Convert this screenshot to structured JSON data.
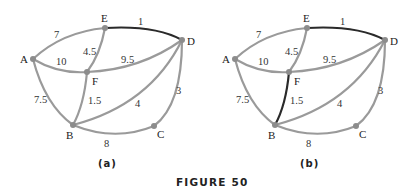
{
  "figure": {
    "caption": "FIGURE 50",
    "colors": {
      "edge": "#9a9a9a",
      "highlighted_edge": "#2a2a2a",
      "node": "#8c8c8c",
      "text": "#222222"
    }
  },
  "graphs": [
    {
      "sublabel": "(a)",
      "vertices": [
        "A",
        "B",
        "C",
        "D",
        "E",
        "F"
      ],
      "edges": [
        {
          "from": "A",
          "to": "E",
          "weight": "7",
          "highlighted": false
        },
        {
          "from": "E",
          "to": "D",
          "weight": "1",
          "highlighted": true
        },
        {
          "from": "E",
          "to": "F",
          "weight": "4.5",
          "highlighted": false
        },
        {
          "from": "A",
          "to": "F",
          "weight": "10",
          "highlighted": false
        },
        {
          "from": "F",
          "to": "D",
          "weight": "9.5",
          "highlighted": false
        },
        {
          "from": "A",
          "to": "B",
          "weight": "7.5",
          "highlighted": false
        },
        {
          "from": "F",
          "to": "B",
          "weight": "1.5",
          "highlighted": false
        },
        {
          "from": "B",
          "to": "D",
          "weight": "4",
          "highlighted": false
        },
        {
          "from": "D",
          "to": "C",
          "weight": "3",
          "highlighted": false
        },
        {
          "from": "B",
          "to": "C",
          "weight": "8",
          "highlighted": false
        }
      ]
    },
    {
      "sublabel": "(b)",
      "vertices": [
        "A",
        "B",
        "C",
        "D",
        "E",
        "F"
      ],
      "edges": [
        {
          "from": "A",
          "to": "E",
          "weight": "7",
          "highlighted": false
        },
        {
          "from": "E",
          "to": "D",
          "weight": "1",
          "highlighted": true
        },
        {
          "from": "E",
          "to": "F",
          "weight": "4.5",
          "highlighted": false
        },
        {
          "from": "A",
          "to": "F",
          "weight": "10",
          "highlighted": false
        },
        {
          "from": "F",
          "to": "D",
          "weight": "9.5",
          "highlighted": false
        },
        {
          "from": "A",
          "to": "B",
          "weight": "7.5",
          "highlighted": false
        },
        {
          "from": "F",
          "to": "B",
          "weight": "1.5",
          "highlighted": true
        },
        {
          "from": "B",
          "to": "D",
          "weight": "4",
          "highlighted": false
        },
        {
          "from": "D",
          "to": "C",
          "weight": "3",
          "highlighted": false
        },
        {
          "from": "B",
          "to": "C",
          "weight": "8",
          "highlighted": false
        }
      ]
    }
  ]
}
